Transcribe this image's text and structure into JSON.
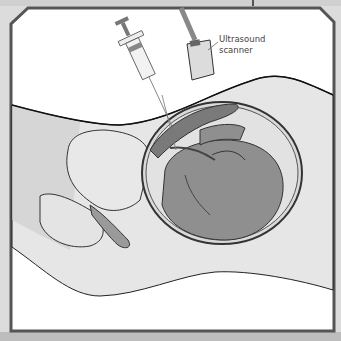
{
  "figure": {
    "labels": {
      "ultrasound_line1": "Ultrasound",
      "ultrasound_line2": "scanner"
    }
  },
  "colors": {
    "background": "#dcdcdc",
    "frame": "#555555",
    "panel": "#ffffff",
    "body_fill": "#e6e6e6",
    "tissue_mid": "#b5b5b5",
    "fetus": "#8f8f8f",
    "outline": "#2a2a2a"
  }
}
